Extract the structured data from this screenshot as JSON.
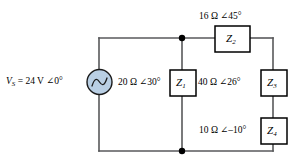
{
  "figure": {
    "background_color": "#ffffff",
    "wire_color": "#58595b",
    "source_fill_color": "#b9cfe4",
    "box_stroke_color": "#000000"
  },
  "source": {
    "name": "voltage-source",
    "label_prefix": "V",
    "label_subscript": "S",
    "label_rest": " = 24 V ∠0°",
    "full_label": "VS = 24 V ∠0°",
    "magnitude": "24 V",
    "angle": "∠0°",
    "symbol": "ac-sine"
  },
  "components": [
    {
      "id": "Z1",
      "box_label": "Z",
      "box_subscript": "1",
      "value_label": "20 Ω ∠30°",
      "magnitude": "20 Ω",
      "angle": "∠30°",
      "orientation": "vertical"
    },
    {
      "id": "Z2",
      "box_label": "Z",
      "box_subscript": "2",
      "value_label": "16 Ω ∠45°",
      "magnitude": "16 Ω",
      "angle": "∠45°",
      "orientation": "horizontal"
    },
    {
      "id": "Z3",
      "box_label": "Z",
      "box_subscript": "3",
      "value_label": "40 Ω ∠26°",
      "magnitude": "40 Ω",
      "angle": "∠26°",
      "orientation": "vertical"
    },
    {
      "id": "Z4",
      "box_label": "Z",
      "box_subscript": "4",
      "value_label": "10 Ω ∠–10°",
      "magnitude": "10 Ω",
      "angle": "∠–10°",
      "orientation": "vertical"
    }
  ],
  "nodes": [
    {
      "name": "top-node",
      "x": 182,
      "y": 38
    },
    {
      "name": "bottom-node",
      "x": 182,
      "y": 151
    }
  ]
}
